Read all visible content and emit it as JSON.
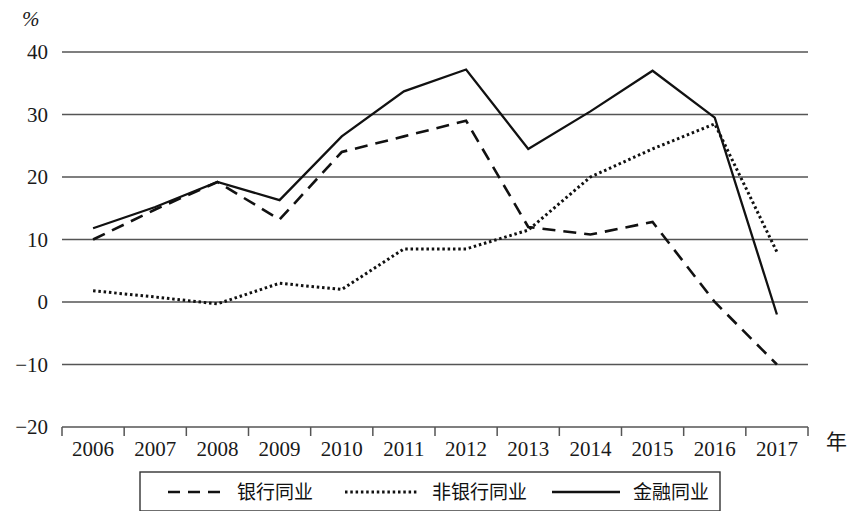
{
  "chart_data": {
    "type": "line",
    "title": "",
    "xlabel": "年",
    "ylabel": "%",
    "x": [
      "2006",
      "2007",
      "2008",
      "2009",
      "2010",
      "2011",
      "2012",
      "2013",
      "2014",
      "2015",
      "2016",
      "2017"
    ],
    "categories": [
      "2006",
      "2007",
      "2008",
      "2009",
      "2010",
      "2011",
      "2012",
      "2013",
      "2014",
      "2015",
      "2016",
      "2017"
    ],
    "ylim": [
      -20,
      40
    ],
    "yticks": [
      "40",
      "30",
      "20",
      "10",
      "0",
      "-10",
      "-20"
    ],
    "ytick_values": [
      40,
      30,
      20,
      10,
      0,
      -10,
      -20
    ],
    "grid": "horizontal",
    "legend_position": "bottom",
    "series": [
      {
        "name": "银行同业",
        "style": "dashed",
        "color": "#111111",
        "values": [
          10.0,
          14.8,
          19.2,
          13.2,
          24.0,
          26.5,
          29.0,
          12.0,
          10.8,
          12.8,
          0.0,
          -10.0
        ]
      },
      {
        "name": "非银行同业",
        "style": "dotted",
        "color": "#111111",
        "values": [
          1.8,
          0.8,
          -0.3,
          3.0,
          2.0,
          8.5,
          8.5,
          11.5,
          20.0,
          24.5,
          28.5,
          8.0
        ]
      },
      {
        "name": "金融同业",
        "style": "solid",
        "color": "#111111",
        "values": [
          11.8,
          15.2,
          19.2,
          16.3,
          26.5,
          33.7,
          37.2,
          24.5,
          30.5,
          37.0,
          29.5,
          -2.0
        ]
      }
    ]
  },
  "legend": {
    "items": [
      {
        "label": "银行同业",
        "style": "dashed"
      },
      {
        "label": "非银行同业",
        "style": "dotted"
      },
      {
        "label": "金融同业",
        "style": "solid"
      }
    ]
  },
  "axis": {
    "y_unit": "%",
    "x_unit": "年"
  }
}
